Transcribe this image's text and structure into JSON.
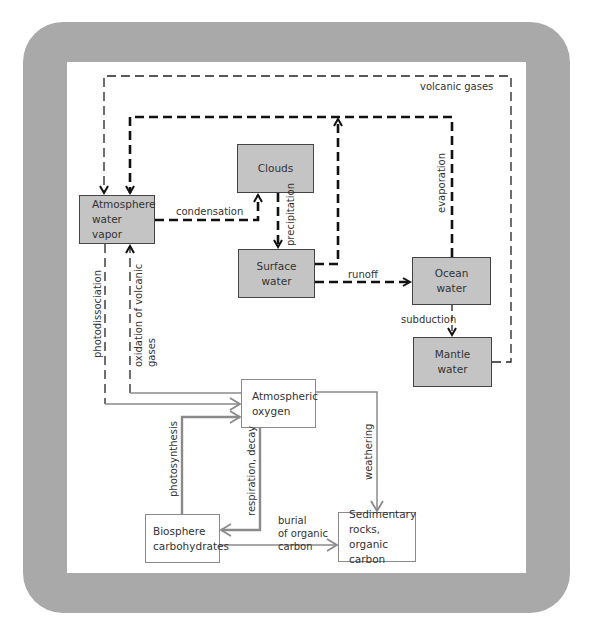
{
  "diagram": {
    "colors": {
      "frame": "#a9a9a9",
      "gray_box": "#c4c4c4",
      "water_flow": "#111111",
      "oxygen_flow": "#8a8a8a"
    },
    "nodes": {
      "atmosphere_water_vapor": "Atmosphere\nwater\nvapor",
      "clouds": "Clouds",
      "surface_water": "Surface\nwater",
      "ocean_water": "Ocean\nwater",
      "mantle_water": "Mantle\nwater",
      "atmospheric_oxygen": "Atmospheric\noxygen",
      "biosphere_carbohydrates": "Biosphere\ncarbohydrates",
      "sedimentary_rocks": "Sedimentary\nrocks, organic\ncarbon"
    },
    "edges": {
      "volcanic_gases": "volcanic gases",
      "condensation": "condensation",
      "precipitation": "precipitation",
      "evaporation": "evaporation",
      "runoff": "runoff",
      "subduction": "subduction",
      "photodissociation": "photodissociation",
      "oxidation_of_volcanic_gases_1": "oxidation of volcanic",
      "oxidation_of_volcanic_gases_2": "gases",
      "photosynthesis": "photosynthesis",
      "respiration_decay": "respiration, decay",
      "weathering": "weathering",
      "burial_1": "burial",
      "burial_2": "of organic",
      "burial_3": "carbon"
    }
  }
}
